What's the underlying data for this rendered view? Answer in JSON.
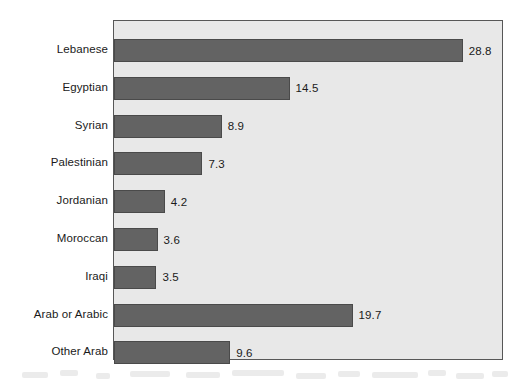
{
  "chart_data": {
    "type": "bar",
    "orientation": "horizontal",
    "title": "",
    "subtitle": "",
    "xlabel": "",
    "ylabel": "",
    "categories": [
      "Lebanese",
      "Egyptian",
      "Syrian",
      "Palestinian",
      "Jordanian",
      "Moroccan",
      "Iraqi",
      "Arab or Arabic",
      "Other Arab"
    ],
    "values": [
      28.8,
      14.5,
      8.9,
      7.3,
      4.2,
      3.6,
      3.5,
      19.7,
      9.6
    ],
    "value_labels": [
      "28.8",
      "14.5",
      "8.9",
      "7.3",
      "4.2",
      "3.6",
      "3.5",
      "19.7",
      "9.6"
    ],
    "xlim": [
      0,
      32.2
    ],
    "grid": false,
    "legend": false,
    "legend_position": "none",
    "bar_color": "#636363",
    "plot_background": "#e8e8e8",
    "border_color": "#575757",
    "text_color": "#1a1a1a"
  }
}
